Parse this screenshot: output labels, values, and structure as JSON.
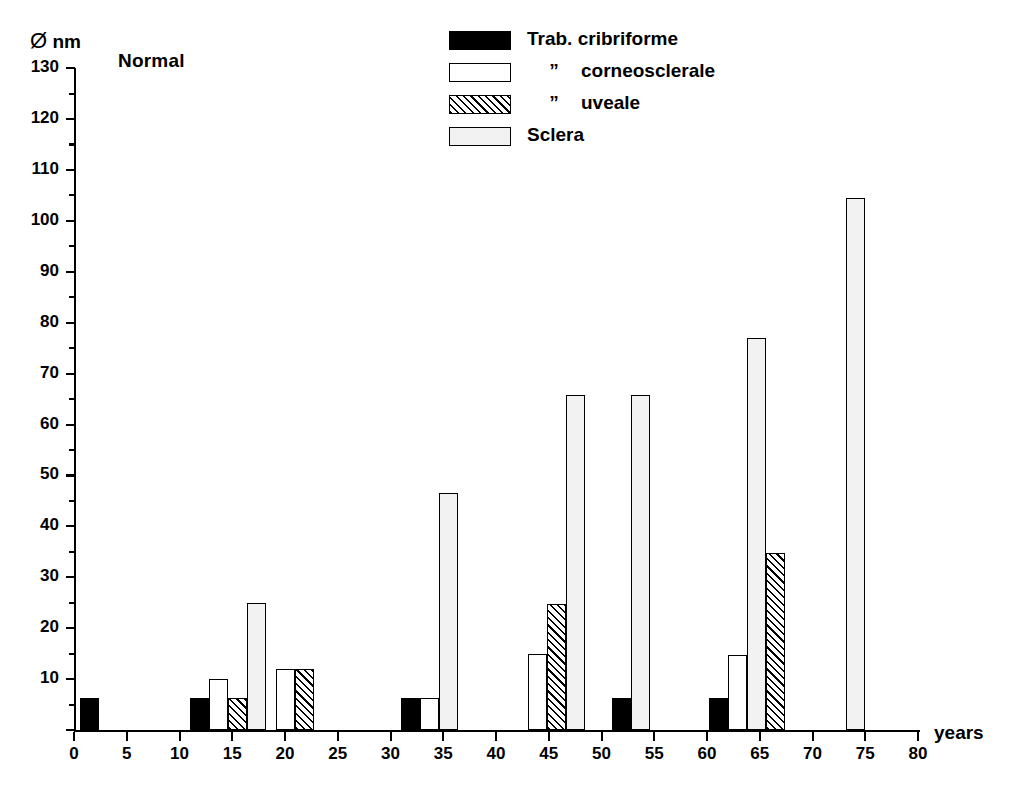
{
  "chart_data": {
    "type": "bar",
    "title": "Normal",
    "xlabel": "years",
    "ylabel": "Ø nm",
    "ylabel_symbol": "Ø",
    "ylabel_unit": "nm",
    "xlim": [
      0,
      80
    ],
    "ylim": [
      0,
      130
    ],
    "ytick_interval": 10,
    "yminor_interval": 5,
    "xtick_interval": 5,
    "grid": false,
    "legend_position": "top-center",
    "xticks": [
      "0",
      "5",
      "10",
      "15",
      "20",
      "25",
      "30",
      "35",
      "40",
      "45",
      "50",
      "55",
      "60",
      "65",
      "70",
      "75",
      "80"
    ],
    "yticks": [
      "0",
      "10",
      "20",
      "30",
      "40",
      "50",
      "60",
      "70",
      "80",
      "90",
      "100",
      "110",
      "120",
      "130"
    ],
    "series": [
      {
        "name": "Trab. cribriforme",
        "fill": "solid"
      },
      {
        "name": "”     corneosclerale",
        "fill": "empty"
      },
      {
        "name": "”     uveale",
        "fill": "hatch"
      },
      {
        "name": "Sclera",
        "fill": "stipple"
      }
    ],
    "legend_entries": [
      {
        "label": "Trab. cribriforme",
        "fill": "solid",
        "prefix": ""
      },
      {
        "label": "corneosclerale",
        "fill": "empty",
        "prefix": "”"
      },
      {
        "label": "uveale",
        "fill": "hatch",
        "prefix": "”"
      },
      {
        "label": "Sclera",
        "fill": "stipple",
        "prefix": ""
      }
    ],
    "bars": [
      {
        "group": "0-2",
        "series": "Trab. cribriforme",
        "fill": "solid",
        "x_start": 0.55,
        "x_end": 2.4,
        "value": 6.2
      },
      {
        "group": "11-17",
        "series": "Trab. cribriforme",
        "fill": "solid",
        "x_start": 11.0,
        "x_end": 12.8,
        "value": 6.2
      },
      {
        "group": "11-17",
        "series": "” corneosclerale",
        "fill": "empty",
        "x_start": 12.8,
        "x_end": 14.6,
        "value": 10.0
      },
      {
        "group": "11-17",
        "series": "” uveale",
        "fill": "hatch",
        "x_start": 14.6,
        "x_end": 16.4,
        "value": 6.2
      },
      {
        "group": "11-17",
        "series": "Sclera",
        "fill": "stipple",
        "x_start": 16.4,
        "x_end": 18.2,
        "value": 25.0
      },
      {
        "group": "19-22",
        "series": "” corneosclerale",
        "fill": "empty",
        "x_start": 19.1,
        "x_end": 20.9,
        "value": 12.0
      },
      {
        "group": "19-22",
        "series": "” uveale",
        "fill": "hatch",
        "x_start": 20.9,
        "x_end": 22.7,
        "value": 12.0
      },
      {
        "group": "31-36",
        "series": "Trab. cribriforme",
        "fill": "solid",
        "x_start": 31.0,
        "x_end": 32.8,
        "value": 6.2
      },
      {
        "group": "31-36",
        "series": "” corneosclerale",
        "fill": "empty",
        "x_start": 32.8,
        "x_end": 34.6,
        "value": 6.2
      },
      {
        "group": "31-36",
        "series": "Sclera",
        "fill": "stipple",
        "x_start": 34.6,
        "x_end": 36.4,
        "value": 46.5
      },
      {
        "group": "43-48",
        "series": "” corneosclerale",
        "fill": "empty",
        "x_start": 43.0,
        "x_end": 44.8,
        "value": 15.0
      },
      {
        "group": "43-48",
        "series": "” uveale",
        "fill": "hatch",
        "x_start": 44.8,
        "x_end": 46.6,
        "value": 24.7
      },
      {
        "group": "43-48",
        "series": "Sclera",
        "fill": "stipple",
        "x_start": 46.6,
        "x_end": 48.4,
        "value": 65.8
      },
      {
        "group": "51-55",
        "series": "Trab. cribriforme",
        "fill": "solid",
        "x_start": 51.0,
        "x_end": 52.8,
        "value": 6.2
      },
      {
        "group": "51-55",
        "series": "Sclera",
        "fill": "stipple",
        "x_start": 52.8,
        "x_end": 54.6,
        "value": 65.8
      },
      {
        "group": "60-67",
        "series": "Trab. cribriforme",
        "fill": "solid",
        "x_start": 60.2,
        "x_end": 62.0,
        "value": 6.2
      },
      {
        "group": "60-67",
        "series": "” corneosclerale",
        "fill": "empty",
        "x_start": 62.0,
        "x_end": 63.8,
        "value": 14.8
      },
      {
        "group": "60-67",
        "series": "Sclera",
        "fill": "stipple",
        "x_start": 63.8,
        "x_end": 65.6,
        "value": 77.0
      },
      {
        "group": "60-67",
        "series": "” uveale",
        "fill": "hatch",
        "x_start": 65.6,
        "x_end": 67.4,
        "value": 34.7
      },
      {
        "group": "73-75",
        "series": "Sclera",
        "fill": "stipple",
        "x_start": 73.2,
        "x_end": 75.0,
        "value": 104.5
      }
    ]
  }
}
